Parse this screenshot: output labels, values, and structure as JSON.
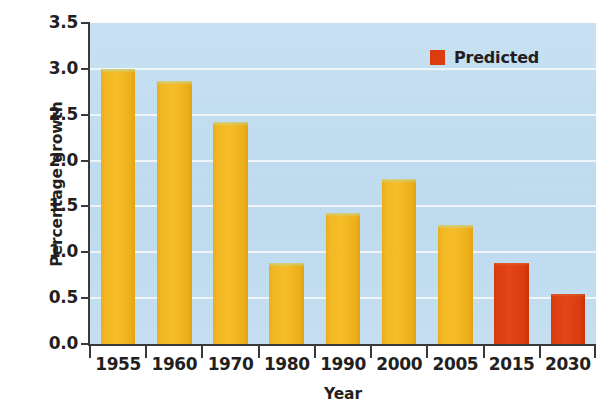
{
  "chart_data": {
    "type": "bar",
    "title": "",
    "subtitle": "",
    "xlabel": "Year",
    "ylabel": "Percentage growth",
    "categories": [
      "1955",
      "1960",
      "1970",
      "1980",
      "1990",
      "2000",
      "2005",
      "2015",
      "2030"
    ],
    "values": [
      3.0,
      2.87,
      2.42,
      0.88,
      1.43,
      1.8,
      1.3,
      0.88,
      0.55
    ],
    "point_kinds": [
      "actual",
      "actual",
      "actual",
      "actual",
      "actual",
      "actual",
      "actual",
      "predicted",
      "predicted"
    ],
    "series": [
      {
        "name": "Percentage growth",
        "values": [
          3.0,
          2.87,
          2.42,
          0.88,
          1.43,
          1.8,
          1.3,
          0.88,
          0.55
        ]
      }
    ],
    "ylim": [
      0.0,
      3.5
    ],
    "ytick_values": [
      0.0,
      0.5,
      1.0,
      1.5,
      2.0,
      2.5,
      3.0,
      3.5
    ],
    "ytick_labels": [
      "0.0",
      "0.5",
      "1.0",
      "1.5",
      "2.0",
      "2.5",
      "3.0",
      "3.5"
    ],
    "grid": true,
    "grid_axis": "y",
    "legend": {
      "position": "top-right",
      "entries": [
        {
          "label": "Predicted",
          "color": "#dc3d10",
          "marker": "square"
        }
      ]
    },
    "colors": {
      "bar_actual": "#f2b723",
      "bar_predicted": "#dc3d10",
      "plot_background": "#bfdcf0",
      "gridline": "#f2f7fb",
      "axis": "#3a3a3c",
      "text": "#231f20"
    },
    "annotations": []
  },
  "axes": {
    "y_title": "Percentage growth",
    "x_title": "Year"
  },
  "legend": {
    "predicted_label": "Predicted"
  }
}
